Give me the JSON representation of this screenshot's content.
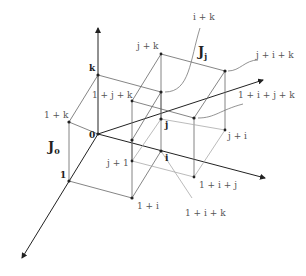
{
  "diagram": {
    "regions": [
      {
        "id": "J0",
        "label": "J",
        "subscript": "0"
      },
      {
        "id": "Jj",
        "label": "J",
        "subscript": "j"
      }
    ],
    "axes": [
      {
        "id": "k-axis",
        "direction": "up"
      },
      {
        "id": "1-axis",
        "direction": "down-left"
      },
      {
        "id": "i-axis",
        "direction": "right-down"
      },
      {
        "id": "j-axis",
        "direction": "right-up"
      }
    ],
    "vertices": {
      "origin": "0",
      "k": "k",
      "one": "1",
      "one_plus_k": "1 + k",
      "i": "i",
      "j": "j",
      "one_plus_i": "1 + i",
      "j_plus_k": "j + k",
      "one_plus_j_plus_k": "1 + j + k",
      "j_plus_i_plus_k": "j + i + k",
      "j_plus_i": "j + i",
      "one_plus_i_plus_j": "1 + i + j",
      "j_plus_one": "j + 1",
      "i_plus_k": "i + k",
      "one_plus_i_plus_j_plus_k": "1 + i + j + k",
      "one_plus_i_plus_k": "1 + i + k"
    }
  }
}
